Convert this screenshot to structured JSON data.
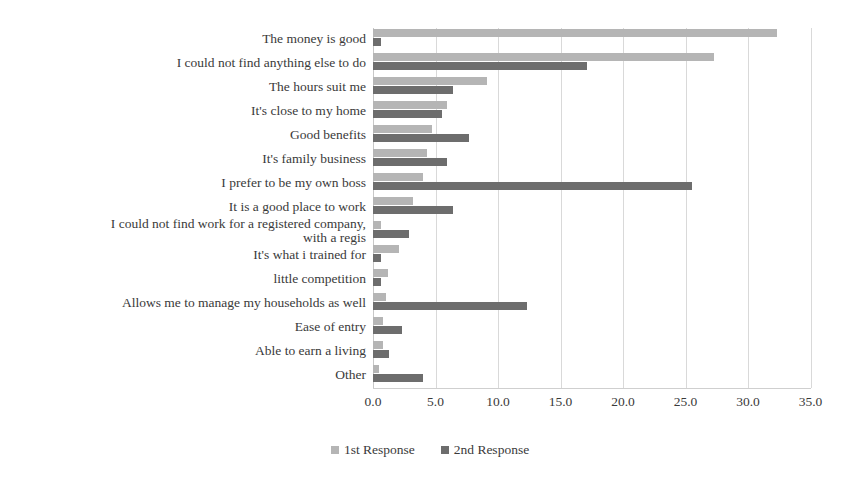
{
  "chart_data": {
    "type": "bar",
    "orientation": "horizontal",
    "title": "",
    "xlabel": "",
    "ylabel": "",
    "xlim": [
      0.0,
      35.0
    ],
    "xticks": [
      "0.0",
      "5.0",
      "10.0",
      "15.0",
      "20.0",
      "25.0",
      "30.0",
      "35.0"
    ],
    "xtick_values": [
      0,
      5,
      10,
      15,
      20,
      25,
      30,
      35
    ],
    "grid": true,
    "grid_axis": "x",
    "legend_position": "bottom-center",
    "categories": [
      "The money is good",
      "I could not find anything else to do",
      "The hours suit me",
      "It's close to my home",
      "Good benefits",
      "It's family business",
      "I prefer to be my own boss",
      "It is a good place to work",
      "I could not find work for a registered company,\nwith a regis",
      "It's what i trained for",
      "little competition",
      "Allows me to manage my households as well",
      "Ease of entry",
      "Able to earn a living",
      "Other"
    ],
    "series": [
      {
        "name": "1st Response",
        "color": "#b5b5b5",
        "values": [
          32.3,
          27.3,
          9.1,
          5.9,
          4.7,
          4.3,
          4.0,
          3.2,
          0.6,
          2.1,
          1.2,
          1.0,
          0.8,
          0.8,
          0.5
        ]
      },
      {
        "name": "2nd Response",
        "color": "#6d6d6d",
        "values": [
          0.6,
          17.1,
          6.4,
          5.5,
          7.7,
          5.9,
          25.5,
          6.4,
          2.9,
          0.6,
          0.6,
          12.3,
          2.3,
          1.3,
          4.0
        ]
      }
    ]
  },
  "legend": {
    "items": [
      {
        "label": "1st Response",
        "color": "#b5b5b5"
      },
      {
        "label": "2nd Response",
        "color": "#6d6d6d"
      }
    ]
  },
  "artifact": {
    "smudge_text": ""
  }
}
